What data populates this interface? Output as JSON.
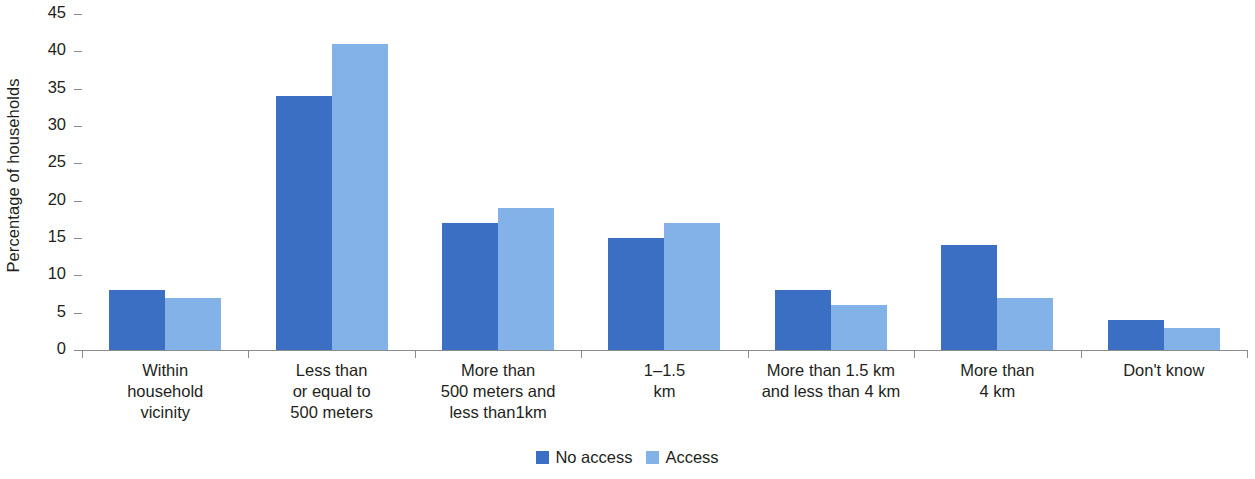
{
  "chart_data": {
    "type": "bar",
    "title": "",
    "xlabel": "",
    "ylabel": "Percentage of households",
    "ylim": [
      0,
      45
    ],
    "yticks": [
      0,
      5,
      10,
      15,
      20,
      25,
      30,
      35,
      40,
      45
    ],
    "grid": false,
    "legend_position": "bottom",
    "categories": [
      "Within\nhousehold\nvicinity",
      "Less than\nor equal to\n500 meters",
      "More than\n500 meters and\nless than1km",
      "1–1.5\nkm",
      "More than 1.5 km\nand less than 4 km",
      "More than\n4 km",
      "Don't know"
    ],
    "series": [
      {
        "name": "No access",
        "color": "#3a6fc4",
        "values": [
          8,
          34,
          17,
          15,
          8,
          14,
          4
        ]
      },
      {
        "name": "Access",
        "color": "#82b2e8",
        "values": [
          7,
          41,
          19,
          17,
          6,
          7,
          3
        ]
      }
    ]
  },
  "axis": {
    "y_title": "Percentage of households",
    "y_tick_labels": [
      "0",
      "5",
      "10",
      "15",
      "20",
      "25",
      "30",
      "35",
      "40",
      "45"
    ],
    "x_tick_labels": [
      [
        "Within",
        "household",
        "vicinity"
      ],
      [
        "Less than",
        "or equal to",
        "500 meters"
      ],
      [
        "More than",
        "500 meters and",
        "less than1km"
      ],
      [
        "1–1.5",
        "km"
      ],
      [
        "More than 1.5 km",
        "and less than 4 km"
      ],
      [
        "More than",
        "4 km"
      ],
      [
        "Don't know"
      ]
    ]
  },
  "legend": {
    "items": [
      {
        "label": "No access",
        "color": "#3a6fc4",
        "swatch_icon": "square-swatch-icon"
      },
      {
        "label": "Access",
        "color": "#82b2e8",
        "swatch_icon": "square-swatch-icon"
      }
    ]
  },
  "colors": {
    "series_no_access": "#3a6fc4",
    "series_access": "#82b2e8",
    "axis": "#8c8c8c",
    "text": "#231f20",
    "background": "#ffffff"
  }
}
